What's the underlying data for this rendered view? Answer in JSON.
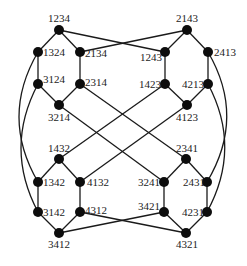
{
  "diagram": {
    "nodes": [
      {
        "id": "1234",
        "x": 59,
        "y": 30,
        "lx": 48,
        "ly": 22
      },
      {
        "id": "1324",
        "x": 38,
        "y": 52,
        "lx": 43,
        "ly": 56
      },
      {
        "id": "2134",
        "x": 80,
        "y": 52,
        "lx": 85,
        "ly": 57
      },
      {
        "id": "3124",
        "x": 38,
        "y": 84,
        "lx": 43,
        "ly": 83
      },
      {
        "id": "2314",
        "x": 80,
        "y": 84,
        "lx": 85,
        "ly": 86
      },
      {
        "id": "3214",
        "x": 59,
        "y": 105,
        "lx": 48,
        "ly": 121
      },
      {
        "id": "2143",
        "x": 187,
        "y": 30,
        "lx": 176,
        "ly": 22
      },
      {
        "id": "1243",
        "x": 165,
        "y": 52,
        "lx": 140,
        "ly": 61
      },
      {
        "id": "2413",
        "x": 208,
        "y": 52,
        "lx": 214,
        "ly": 56
      },
      {
        "id": "1423",
        "x": 165,
        "y": 84,
        "lx": 139,
        "ly": 88
      },
      {
        "id": "4213",
        "x": 208,
        "y": 84,
        "lx": 182,
        "ly": 88
      },
      {
        "id": "4123",
        "x": 187,
        "y": 105,
        "lx": 176,
        "ly": 121
      },
      {
        "id": "1432",
        "x": 59,
        "y": 159,
        "lx": 48,
        "ly": 152
      },
      {
        "id": "1342",
        "x": 38,
        "y": 182,
        "lx": 43,
        "ly": 186
      },
      {
        "id": "4132",
        "x": 80,
        "y": 182,
        "lx": 87,
        "ly": 186
      },
      {
        "id": "3142",
        "x": 38,
        "y": 212,
        "lx": 43,
        "ly": 216
      },
      {
        "id": "4312",
        "x": 80,
        "y": 212,
        "lx": 85,
        "ly": 214
      },
      {
        "id": "3412",
        "x": 59,
        "y": 233,
        "lx": 48,
        "ly": 248
      },
      {
        "id": "2341",
        "x": 186,
        "y": 159,
        "lx": 176,
        "ly": 152
      },
      {
        "id": "3241",
        "x": 164,
        "y": 182,
        "lx": 138,
        "ly": 186
      },
      {
        "id": "2431",
        "x": 207,
        "y": 182,
        "lx": 183,
        "ly": 186
      },
      {
        "id": "3421",
        "x": 164,
        "y": 212,
        "lx": 138,
        "ly": 210
      },
      {
        "id": "4231",
        "x": 207,
        "y": 212,
        "lx": 182,
        "ly": 216
      },
      {
        "id": "4321",
        "x": 186,
        "y": 233,
        "lx": 176,
        "ly": 248
      }
    ],
    "edges": [
      [
        "1234",
        "1324"
      ],
      [
        "1234",
        "2134"
      ],
      [
        "1234",
        "1243"
      ],
      [
        "2134",
        "2143"
      ],
      [
        "1324",
        "3124"
      ],
      [
        "2134",
        "2314"
      ],
      [
        "3124",
        "3214"
      ],
      [
        "2314",
        "3214"
      ],
      [
        "2143",
        "1243"
      ],
      [
        "2143",
        "2413"
      ],
      [
        "1243",
        "1423"
      ],
      [
        "2413",
        "4213"
      ],
      [
        "1423",
        "4123"
      ],
      [
        "4213",
        "4123"
      ],
      [
        "3214",
        "3241"
      ],
      [
        "2314",
        "2341"
      ],
      [
        "1423",
        "1432"
      ],
      [
        "4123",
        "4132"
      ],
      [
        "1432",
        "1342"
      ],
      [
        "1432",
        "4132"
      ],
      [
        "1342",
        "3142"
      ],
      [
        "4132",
        "4312"
      ],
      [
        "3142",
        "3412"
      ],
      [
        "4312",
        "3412"
      ],
      [
        "4312",
        "4321"
      ],
      [
        "3412",
        "3421"
      ],
      [
        "2341",
        "3241"
      ],
      [
        "2341",
        "2431"
      ],
      [
        "3241",
        "3421"
      ],
      [
        "2431",
        "4231"
      ],
      [
        "3421",
        "4321"
      ],
      [
        "4231",
        "4321"
      ]
    ],
    "arcs": [
      {
        "from": "1324",
        "to": "1342",
        "cx": 0,
        "cy": 117
      },
      {
        "from": "3124",
        "to": "3142",
        "cx": 4,
        "cy": 148
      },
      {
        "from": "2413",
        "to": "2431",
        "cx": 246,
        "cy": 117
      },
      {
        "from": "4213",
        "to": "4231",
        "cx": 242,
        "cy": 148
      }
    ]
  }
}
